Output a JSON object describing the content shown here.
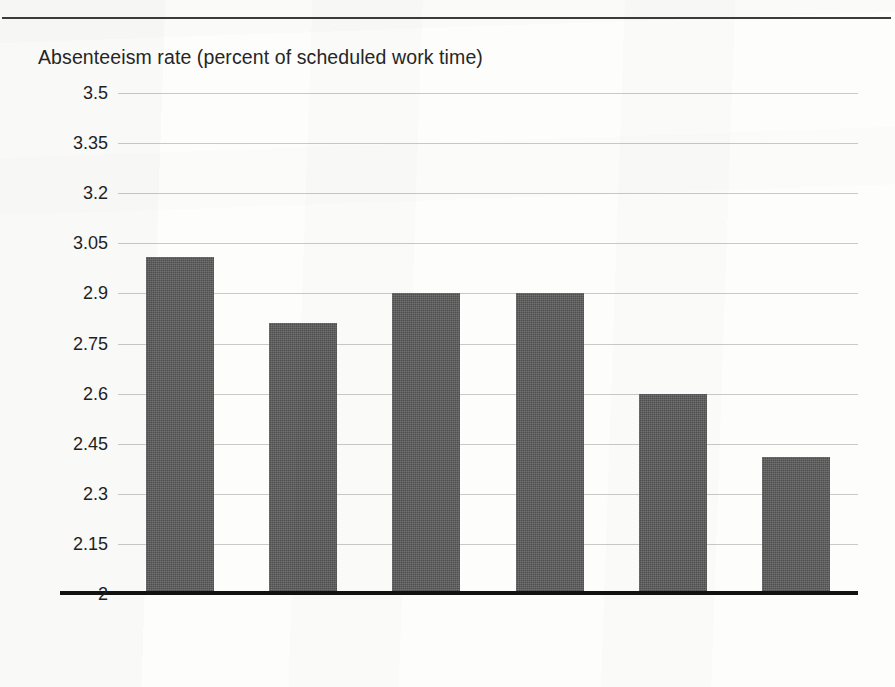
{
  "figure": {
    "background_color": "#fdfdfc",
    "rule_color": "#3c3c3c"
  },
  "chart_data": {
    "type": "bar",
    "title": "",
    "subtitle": "",
    "ylabel": "Absenteeism rate (percent of scheduled work time)",
    "xlabel": "Year",
    "categories": [
      "1976",
      "1977",
      "1978",
      "1979",
      "1980",
      "1981"
    ],
    "values": [
      3.01,
      2.81,
      2.9,
      2.9,
      2.6,
      2.41
    ],
    "series": [
      {
        "name": "Absenteeism rate",
        "values": [
          3.01,
          2.81,
          2.9,
          2.9,
          2.6,
          2.41
        ]
      }
    ],
    "ylim": [
      2,
      3.5
    ],
    "xlim_categories": 6,
    "ytick_labels": [
      "3.5",
      "3.35",
      "3.2",
      "3.05",
      "2.9",
      "2.75",
      "2.6",
      "2.45",
      "2.3",
      "2.15",
      "2"
    ],
    "ytick_values": [
      3.5,
      3.35,
      3.2,
      3.05,
      2.9,
      2.75,
      2.6,
      2.45,
      2.3,
      2.15,
      2
    ],
    "grid": true,
    "grid_color": "#c9c9c9",
    "legend": false,
    "legend_position": "none",
    "bar_color": "#4f4f4f",
    "axis_color": "#121212",
    "annotations": []
  }
}
